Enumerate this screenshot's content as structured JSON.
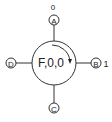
{
  "diagram": {
    "center_node": {
      "label": "F,0,0",
      "arrow": "clockwise-arc"
    },
    "ports": [
      {
        "id": "A",
        "label": "A",
        "position": "top",
        "value": "0"
      },
      {
        "id": "B",
        "label": "B",
        "position": "right",
        "value": "1"
      },
      {
        "id": "C",
        "label": "C",
        "position": "bottom",
        "value": ""
      },
      {
        "id": "D",
        "label": "D",
        "position": "left",
        "value": ""
      }
    ],
    "colors": {
      "stroke": "#222222",
      "background": "#ffffff"
    }
  }
}
